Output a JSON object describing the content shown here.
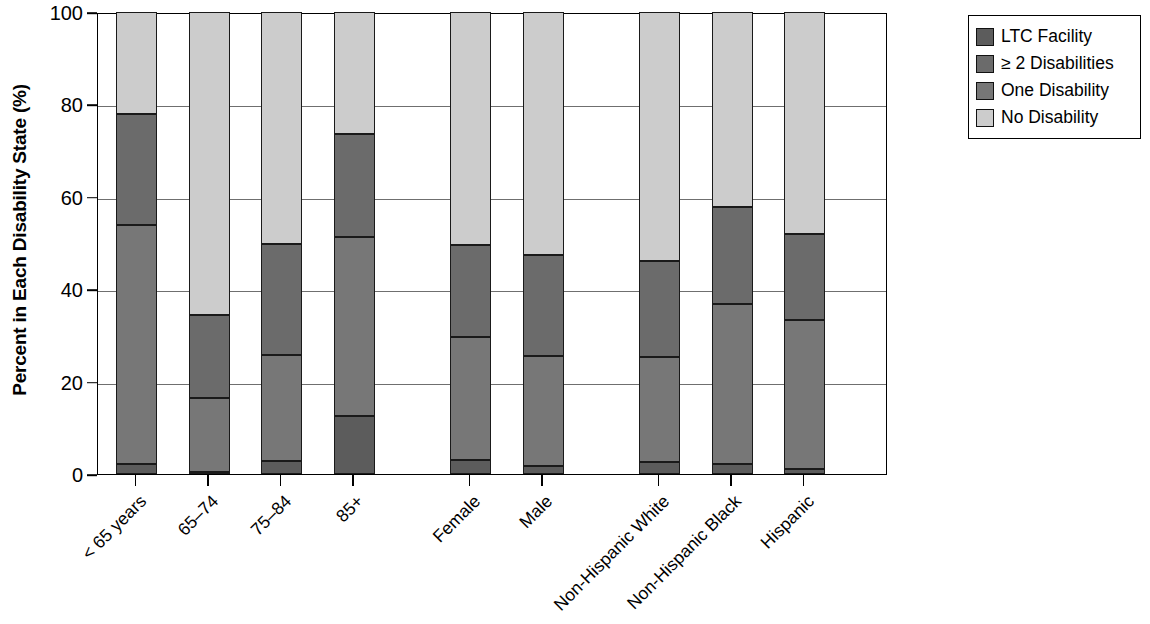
{
  "chart_data": {
    "type": "bar",
    "subtype": "stacked-bar-100",
    "title": "",
    "xlabel": "",
    "ylabel": "Percent in Each Disability State (%)",
    "ylim": [
      0,
      100
    ],
    "yticks": [
      0,
      20,
      40,
      60,
      80,
      100
    ],
    "ytick_labels": [
      "0",
      "20",
      "40",
      "60",
      "80",
      "100"
    ],
    "grid": "horizontal",
    "legend_position": "right-top",
    "categories": [
      "< 65 years",
      "65–74",
      "75–84",
      "85+",
      "Female",
      "Male",
      "Non-Hispanic White",
      "Non-Hispanic Black",
      "Hispanic"
    ],
    "group_gaps_after": [
      3,
      5
    ],
    "series": [
      {
        "name": "LTC Facility",
        "color": "#5c5c5c",
        "values": [
          2.1,
          0.5,
          2.9,
          12.6,
          3.0,
          1.8,
          2.6,
          2.1,
          1.0
        ]
      },
      {
        "name": "One Disability",
        "color": "#777777",
        "values": [
          51.8,
          15.9,
          22.9,
          38.7,
          26.6,
          23.7,
          22.8,
          34.8,
          32.4
        ]
      },
      {
        "name": "≥ 2 Disabilities",
        "color": "#6b6b6b",
        "values": [
          24.0,
          18.1,
          24.0,
          22.2,
          19.9,
          22.0,
          20.6,
          20.8,
          18.6
        ]
      },
      {
        "name": "No Disability",
        "color": "#cccccc",
        "values": [
          22.1,
          65.5,
          50.2,
          26.5,
          50.5,
          52.5,
          54.0,
          42.3,
          48.0
        ]
      }
    ],
    "stack_order_bottom_to_top": [
      "LTC Facility",
      "One Disability",
      "≥ 2 Disabilities",
      "No Disability"
    ],
    "cumulative_tops": {
      "< 65 years": {
        "LTC Facility": 2.1,
        "One Disability": 53.9,
        "≥ 2 Disabilities": 77.9,
        "No Disability": 100
      },
      "65–74": {
        "LTC Facility": 0.5,
        "One Disability": 16.4,
        "≥ 2 Disabilities": 34.5,
        "No Disability": 100
      },
      "75–84": {
        "LTC Facility": 2.9,
        "One Disability": 25.8,
        "≥ 2 Disabilities": 49.8,
        "No Disability": 100
      },
      "85+": {
        "LTC Facility": 12.6,
        "One Disability": 51.3,
        "≥ 2 Disabilities": 73.5,
        "No Disability": 100
      },
      "Female": {
        "LTC Facility": 3.0,
        "One Disability": 29.6,
        "≥ 2 Disabilities": 49.5,
        "No Disability": 100
      },
      "Male": {
        "LTC Facility": 1.8,
        "One Disability": 25.5,
        "≥ 2 Disabilities": 47.5,
        "No Disability": 100
      },
      "Non-Hispanic White": {
        "LTC Facility": 2.6,
        "One Disability": 25.4,
        "≥ 2 Disabilities": 46.0,
        "No Disability": 100
      },
      "Non-Hispanic Black": {
        "LTC Facility": 2.1,
        "One Disability": 36.9,
        "≥ 2 Disabilities": 57.7,
        "No Disability": 100
      },
      "Hispanic": {
        "LTC Facility": 1.0,
        "One Disability": 33.4,
        "≥ 2 Disabilities": 52.0,
        "No Disability": 100
      }
    }
  },
  "legend": {
    "items": [
      {
        "label": "LTC Facility",
        "color": "#5c5c5c"
      },
      {
        "label": "≥ 2 Disabilities",
        "color": "#6b6b6b"
      },
      {
        "label": "One Disability",
        "color": "#777777"
      },
      {
        "label": "No Disability",
        "color": "#cccccc"
      }
    ]
  },
  "axis": {
    "y_title": "Percent in Each Disability State (%)",
    "y_tick_labels": [
      "100",
      "80",
      "60",
      "40",
      "20",
      "0"
    ]
  }
}
